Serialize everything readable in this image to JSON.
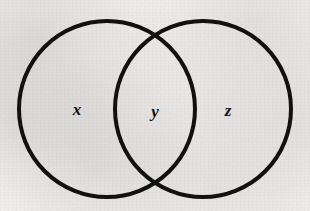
{
  "figure": {
    "kind": "venn-diagram",
    "background_color": "#f2f1ef",
    "ink_color": "#111111",
    "stroke_width": 4
  },
  "circles": [
    {
      "name": "left-circle",
      "cx": 107,
      "cy": 109,
      "r": 88
    },
    {
      "name": "right-circle",
      "cx": 203,
      "cy": 109,
      "r": 88
    }
  ],
  "regions": [
    {
      "id": "x",
      "label": "x",
      "region_name": "left-only-region",
      "x": 77,
      "y": 115
    },
    {
      "id": "y",
      "label": "y",
      "region_name": "intersection-region",
      "x": 155,
      "y": 117
    },
    {
      "id": "z",
      "label": "z",
      "region_name": "right-only-region",
      "x": 228,
      "y": 116
    }
  ],
  "intersection_points": [
    {
      "name": "upper-crossing",
      "x": 155,
      "y": 38
    },
    {
      "name": "lower-crossing",
      "x": 155,
      "y": 182
    }
  ]
}
